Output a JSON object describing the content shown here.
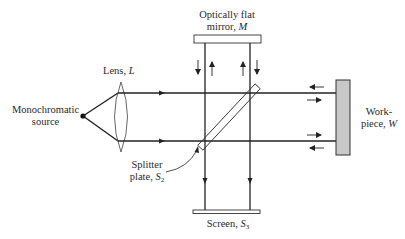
{
  "labels": {
    "source_line1": "Monochromatic",
    "source_line2": "source",
    "lens_text": "Lens, ",
    "lens_symbol": "L",
    "mirror_line1": "Optically flat",
    "mirror_line2_text": "mirror, ",
    "mirror_symbol": "M",
    "splitter_line1": "Splitter",
    "splitter_line2_text": "plate, ",
    "splitter_symbol": "S",
    "splitter_subscript": "2",
    "workpiece_line1": "Work-",
    "workpiece_line2_text": "piece, ",
    "workpiece_symbol": "W",
    "screen_text": "Screen, ",
    "screen_symbol": "S",
    "screen_subscript": "3"
  },
  "colors": {
    "line": "#222222",
    "workpiece_fill": "#c8c8c8",
    "background": "#ffffff"
  }
}
